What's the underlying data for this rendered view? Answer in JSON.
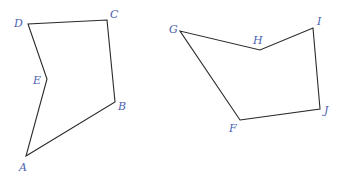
{
  "figures": [
    {
      "name": "pentagon-ABCDE",
      "vertices": [
        {
          "label": "A",
          "x": 26,
          "y": 156,
          "lx": 19,
          "ly": 171
        },
        {
          "label": "B",
          "x": 115,
          "y": 102,
          "lx": 118,
          "ly": 110
        },
        {
          "label": "C",
          "x": 107,
          "y": 20,
          "lx": 110,
          "ly": 18
        },
        {
          "label": "D",
          "x": 28,
          "y": 24,
          "lx": 14,
          "ly": 27
        },
        {
          "label": "E",
          "x": 47,
          "y": 79,
          "lx": 33,
          "ly": 84
        }
      ]
    },
    {
      "name": "pentagon-FGHIJ",
      "vertices": [
        {
          "label": "F",
          "x": 240,
          "y": 120,
          "lx": 229,
          "ly": 132
        },
        {
          "label": "J",
          "x": 320,
          "y": 109,
          "lx": 324,
          "ly": 114
        },
        {
          "label": "I",
          "x": 313,
          "y": 28,
          "lx": 317,
          "ly": 25
        },
        {
          "label": "H",
          "x": 260,
          "y": 50,
          "lx": 253,
          "ly": 44
        },
        {
          "label": "G",
          "x": 180,
          "y": 31,
          "lx": 169,
          "ly": 33
        }
      ]
    }
  ],
  "colors": {
    "edge": "#2a2a2a",
    "label": "#4a5fb0"
  }
}
